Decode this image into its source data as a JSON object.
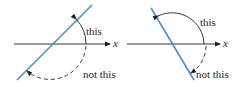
{
  "diagrams": [
    {
      "axis_label": "x",
      "label_solid": "this",
      "label_dashed": "not this",
      "line_slope": "positive"
    },
    {
      "axis_label": "x",
      "label_solid": "this",
      "label_dashed": "not this",
      "line_slope": "negative"
    }
  ],
  "colors": {
    "line": "#4a90d0",
    "axis": "#231f20",
    "arc": "#231f20"
  }
}
